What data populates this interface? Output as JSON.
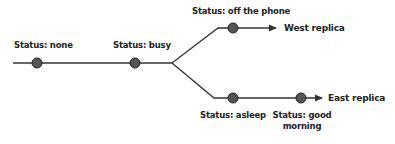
{
  "diagram": {
    "type": "replication-branch",
    "colors": {
      "line": "#333333",
      "node_fill": "#555555",
      "node_stroke": "#222222",
      "text": "#222222"
    },
    "nodes": [
      {
        "id": "n1",
        "label": "Status: none"
      },
      {
        "id": "n2",
        "label": "Status: busy"
      },
      {
        "id": "n3",
        "label": "Status: off the phone"
      },
      {
        "id": "n4",
        "label": "Status: asleep"
      },
      {
        "id": "n5",
        "label_line1": "Status: good",
        "label_line2": "morning"
      }
    ],
    "branches": [
      {
        "name": "West replica"
      },
      {
        "name": "East replica"
      }
    ]
  }
}
